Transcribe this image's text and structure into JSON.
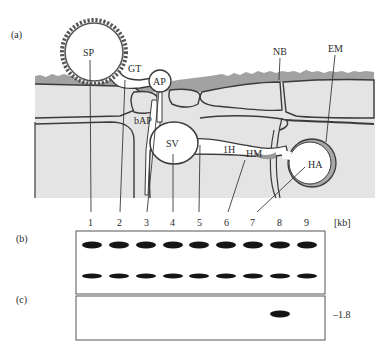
{
  "panels": {
    "a": {
      "label": "(a)"
    },
    "b": {
      "label": "(b)"
    },
    "c": {
      "label": "(c)"
    }
  },
  "structures": {
    "SP": "SP",
    "GT": "GT",
    "AP": "AP",
    "bAP": "bAP",
    "SV": "SV",
    "1H": "1H",
    "HM": "HM",
    "HA": "HA",
    "NB": "NB",
    "EM": "EM"
  },
  "lanes": [
    "1",
    "2",
    "3",
    "4",
    "5",
    "6",
    "7",
    "8",
    "9"
  ],
  "unit_label": "[kb]",
  "blot_b": {
    "bands": [
      {
        "row": "upper",
        "lanes": [
          1,
          2,
          3,
          4,
          5,
          6,
          7,
          8,
          9
        ]
      },
      {
        "row": "lower",
        "lanes": [
          1,
          2,
          3,
          4,
          5,
          6,
          7,
          8,
          9
        ]
      }
    ]
  },
  "blot_c": {
    "bands": [
      {
        "lane": 8,
        "size_label": "–1.8"
      }
    ]
  },
  "colors": {
    "tissue": "#e3e3e3",
    "cuticle": "#9a9a9a",
    "outline": "#3a3a3a",
    "band": "#151515",
    "spore_wall": "#555555"
  }
}
